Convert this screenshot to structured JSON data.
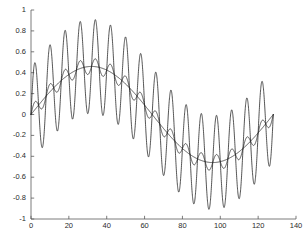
{
  "chart_data": {
    "type": "line",
    "title": "",
    "xlabel": "",
    "ylabel": "",
    "xlim": [
      0,
      140
    ],
    "ylim": [
      -1,
      1
    ],
    "grid": false,
    "legend": null,
    "background": "#ffffff",
    "line_color": "#1c1c1c",
    "axis_color": "#5a5a5a",
    "xticks": [
      0,
      20,
      40,
      60,
      80,
      100,
      120,
      140
    ],
    "xtick_labels": [
      "0",
      "20",
      "40",
      "60",
      "80",
      "100",
      "120",
      "140"
    ],
    "yticks": [
      -1,
      -0.8,
      -0.6,
      -0.4,
      -0.2,
      0,
      0.2,
      0.4,
      0.6,
      0.8,
      1
    ],
    "ytick_labels": [
      "-1",
      "-0.8",
      "-0.6",
      "-0.4",
      "-0.2",
      "0",
      "0.2",
      "0.4",
      "0.6",
      "0.8",
      "1"
    ],
    "x_data_range": [
      0,
      128
    ],
    "n_samples": 129,
    "series": [
      {
        "name": "fundamental",
        "description": "smooth low-frequency sine carrier",
        "form": "0.46*sin(2*pi*n/128)",
        "amplitude": 0.46,
        "cycles_over_range": 1,
        "peak_max": 0.46,
        "peak_min": -0.46
      },
      {
        "name": "fundamental-plus-small-ripple",
        "description": "carrier with low amplitude high-frequency ripple",
        "form": "0.46*sin(2*pi*n/128) + 0.075*sin(2*pi*16*n/128)",
        "amplitude": 0.075,
        "cycles_over_range": 16,
        "peak_max": 0.535,
        "peak_min": -0.535
      },
      {
        "name": "fundamental-plus-large-ripple",
        "description": "carrier with high amplitude high-frequency ripple",
        "form": "0.46*sin(2*pi*n/128) + 0.45*sin(2*pi*16*n/128)",
        "amplitude": 0.45,
        "cycles_over_range": 16,
        "peak_max": 0.91,
        "peak_min": -0.91
      }
    ]
  }
}
